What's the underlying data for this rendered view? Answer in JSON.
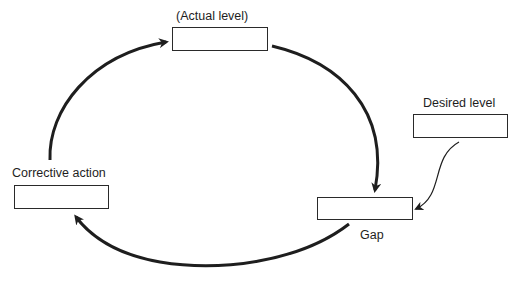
{
  "diagram": {
    "type": "feedback-loop",
    "nodes": [
      {
        "id": "actual",
        "label": "(Actual level)"
      },
      {
        "id": "desired",
        "label": "Desired level"
      },
      {
        "id": "gap",
        "label": "Gap"
      },
      {
        "id": "corrective",
        "label": "Corrective action"
      }
    ],
    "edges": [
      {
        "from": "actual",
        "to": "gap",
        "style": "thick"
      },
      {
        "from": "desired",
        "to": "gap",
        "style": "thin"
      },
      {
        "from": "gap",
        "to": "corrective",
        "style": "thick"
      },
      {
        "from": "corrective",
        "to": "actual",
        "style": "thick"
      }
    ],
    "colors": {
      "stroke": "#1e1e1e",
      "background": "#ffffff"
    }
  }
}
